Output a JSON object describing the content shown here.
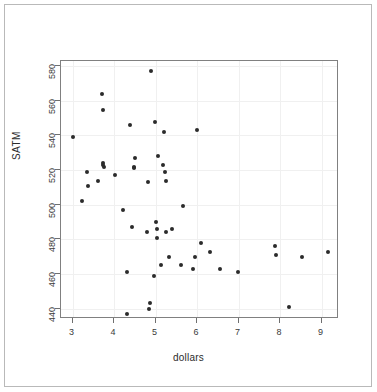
{
  "figure": {
    "background_color": "#ffffff",
    "border_color": "#b9b9b9",
    "panel_border_color": "#808080",
    "point_color": "#2b2b2b",
    "grid_color": "#f0f0f0"
  },
  "chart_data": {
    "type": "scatter",
    "title": "",
    "xlabel": "dollars",
    "ylabel": "SATM",
    "xlim": [
      2.72,
      9.42
    ],
    "ylim": [
      434.0,
      583.0
    ],
    "xticks": [
      3,
      4,
      5,
      6,
      7,
      8,
      9
    ],
    "yticks": [
      440,
      460,
      480,
      500,
      520,
      540,
      560,
      580
    ],
    "xtick_labels": [
      "3",
      "4",
      "5",
      "6",
      "7",
      "8",
      "9"
    ],
    "ytick_labels": [
      "440",
      "460",
      "480",
      "500",
      "520",
      "540",
      "560",
      "580"
    ],
    "grid": true,
    "legend": null,
    "marker": "filled-circle",
    "n_points": 51,
    "points": [
      {
        "x": 3.02,
        "y": 539
      },
      {
        "x": 3.22,
        "y": 502
      },
      {
        "x": 3.34,
        "y": 519
      },
      {
        "x": 3.36,
        "y": 511
      },
      {
        "x": 3.62,
        "y": 514
      },
      {
        "x": 3.7,
        "y": 564
      },
      {
        "x": 3.72,
        "y": 524
      },
      {
        "x": 3.73,
        "y": 523
      },
      {
        "x": 3.75,
        "y": 522
      },
      {
        "x": 3.74,
        "y": 555
      },
      {
        "x": 4.02,
        "y": 517
      },
      {
        "x": 4.21,
        "y": 497
      },
      {
        "x": 4.3,
        "y": 461
      },
      {
        "x": 4.32,
        "y": 437
      },
      {
        "x": 4.39,
        "y": 546
      },
      {
        "x": 4.44,
        "y": 487
      },
      {
        "x": 4.5,
        "y": 527
      },
      {
        "x": 4.47,
        "y": 522
      },
      {
        "x": 4.48,
        "y": 521
      },
      {
        "x": 4.8,
        "y": 484
      },
      {
        "x": 4.82,
        "y": 513
      },
      {
        "x": 4.84,
        "y": 440
      },
      {
        "x": 4.86,
        "y": 443
      },
      {
        "x": 4.88,
        "y": 577
      },
      {
        "x": 4.96,
        "y": 459
      },
      {
        "x": 4.99,
        "y": 548
      },
      {
        "x": 5.02,
        "y": 490
      },
      {
        "x": 5.04,
        "y": 486
      },
      {
        "x": 5.04,
        "y": 481
      },
      {
        "x": 5.06,
        "y": 528
      },
      {
        "x": 5.14,
        "y": 465
      },
      {
        "x": 5.17,
        "y": 523
      },
      {
        "x": 5.2,
        "y": 542
      },
      {
        "x": 5.22,
        "y": 519
      },
      {
        "x": 5.24,
        "y": 514
      },
      {
        "x": 5.26,
        "y": 484
      },
      {
        "x": 5.32,
        "y": 470
      },
      {
        "x": 5.4,
        "y": 486
      },
      {
        "x": 5.6,
        "y": 465
      },
      {
        "x": 5.66,
        "y": 499
      },
      {
        "x": 5.9,
        "y": 463
      },
      {
        "x": 5.96,
        "y": 470
      },
      {
        "x": 6.0,
        "y": 543
      },
      {
        "x": 6.1,
        "y": 478
      },
      {
        "x": 6.32,
        "y": 473
      },
      {
        "x": 6.54,
        "y": 463
      },
      {
        "x": 6.99,
        "y": 461
      },
      {
        "x": 7.88,
        "y": 476
      },
      {
        "x": 7.9,
        "y": 471
      },
      {
        "x": 8.22,
        "y": 441
      },
      {
        "x": 8.52,
        "y": 470
      },
      {
        "x": 9.16,
        "y": 473
      }
    ]
  }
}
